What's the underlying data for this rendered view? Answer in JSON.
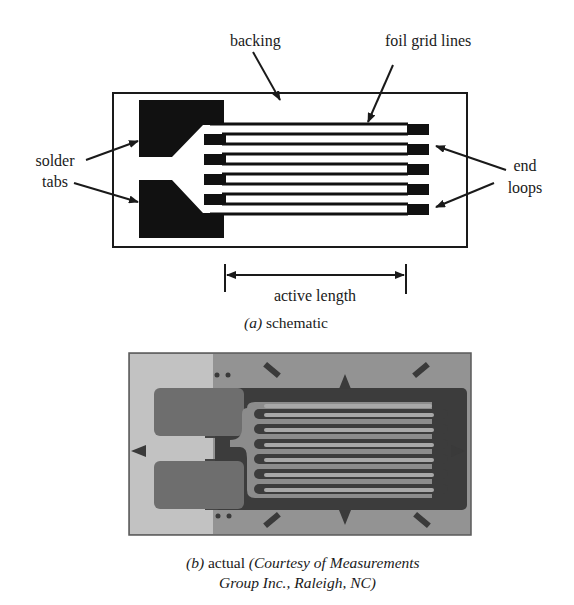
{
  "figure": {
    "part_a": {
      "labels": {
        "backing": "backing",
        "foil_grid_lines": "foil grid lines",
        "solder_line1": "solder",
        "solder_line2": "tabs",
        "end_line1": "end",
        "end_line2": "loops",
        "active_length": "active length"
      },
      "caption": {
        "letter": "(a)",
        "text": " schematic"
      }
    },
    "part_b": {
      "caption": {
        "letter": "(b)",
        "text": " actual ",
        "credit_line1": "(Courtesy of Measurements",
        "credit_line2": "Group Inc., Raleigh, NC)"
      }
    },
    "colors": {
      "ink": "#1a1a1a",
      "photo_bg": "#8f8f8f",
      "photo_light": "#bdbdbd",
      "photo_dark": "#3d3d3d",
      "photo_tab": "#6a6a6a"
    }
  }
}
